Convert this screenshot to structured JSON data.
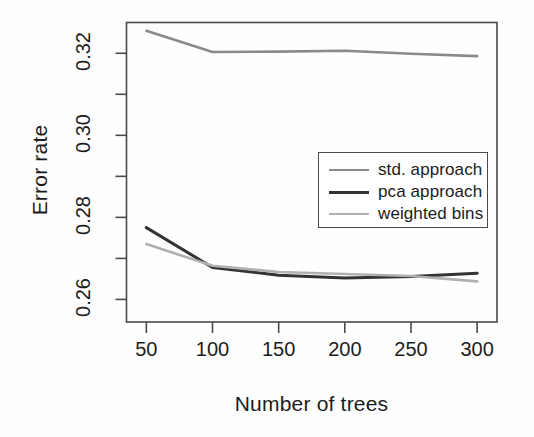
{
  "chart_data": {
    "type": "line",
    "title": "",
    "xlabel": "Number of trees",
    "ylabel": "Error rate",
    "x": [
      50,
      100,
      150,
      200,
      250,
      300
    ],
    "xlim": [
      35,
      315
    ],
    "ylim": [
      0.2545,
      0.3275
    ],
    "xticks": [
      50,
      100,
      150,
      200,
      250,
      300
    ],
    "xtick_labels": [
      "50",
      "100",
      "150",
      "200",
      "250",
      "300"
    ],
    "yticks": [
      0.26,
      0.28,
      0.3,
      0.32
    ],
    "ytick_labels": [
      "0.26",
      "0.28",
      "0.30",
      "0.32"
    ],
    "yminor_ticks": [
      0.25,
      0.27,
      0.29,
      0.31,
      0.33
    ],
    "grid": false,
    "legend_position": "center-right",
    "series": [
      {
        "name": "std. approach",
        "color": "#8a8a8a",
        "width": 2.6,
        "values": [
          0.3255,
          0.3203,
          0.3204,
          0.3206,
          0.3199,
          0.3193
        ]
      },
      {
        "name": "pca approach",
        "color": "#333333",
        "width": 3.0,
        "values": [
          0.2775,
          0.2678,
          0.2659,
          0.2652,
          0.2656,
          0.2664
        ]
      },
      {
        "name": "weighted bins",
        "color": "#b0b0b0",
        "width": 2.6,
        "values": [
          0.2735,
          0.2682,
          0.2667,
          0.2662,
          0.2657,
          0.2644
        ]
      }
    ]
  },
  "axes": {
    "y_label": "Error rate",
    "x_label": "Number of trees"
  },
  "legend": {
    "entries": [
      {
        "label": "std. approach",
        "color": "#8a8a8a",
        "width": 2.6
      },
      {
        "label": "pca approach",
        "color": "#333333",
        "width": 3.0
      },
      {
        "label": "weighted bins",
        "color": "#b0b0b0",
        "width": 2.6
      }
    ]
  },
  "style": {
    "frame_color": "#4a4a4a",
    "text_color": "#1c1c1c",
    "background": "#fefefe"
  }
}
